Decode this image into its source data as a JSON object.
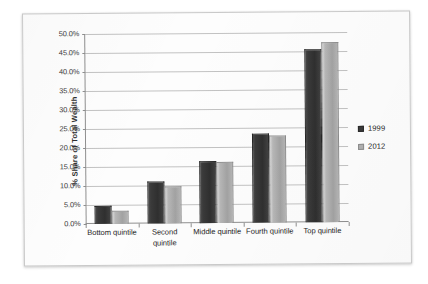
{
  "chart_data": {
    "type": "bar",
    "title": "",
    "subtitle": "",
    "xlabel": "",
    "ylabel": "% Share of Total Wealth",
    "categories": [
      "Bottom quintile",
      "Second quintile",
      "Middle quintile",
      "Fourth quintile",
      "Top quintile"
    ],
    "category_lines": [
      [
        "Bottom quintile"
      ],
      [
        "Second",
        "quintile"
      ],
      [
        "Middle quintile"
      ],
      [
        "Fourth quintile"
      ],
      [
        "Top quintile"
      ]
    ],
    "series": [
      {
        "name": "1999",
        "color": "#3a3a3a",
        "values": [
          4.8,
          11.0,
          16.3,
          23.5,
          45.5
        ]
      },
      {
        "name": "2012",
        "color": "#b0b0b0",
        "values": [
          3.5,
          9.7,
          16.0,
          23.0,
          47.5
        ]
      }
    ],
    "ylim": [
      0,
      50
    ],
    "ytick_values": [
      0,
      5,
      10,
      15,
      20,
      25,
      30,
      35,
      40,
      45,
      50
    ],
    "ytick_labels": [
      "0.0%",
      "5.0%",
      "10.0%",
      "15.0%",
      "20.0%",
      "25.0%",
      "30.0%",
      "35.0%",
      "40.0%",
      "45.0%",
      "50.0%"
    ],
    "grid": true,
    "grid_axis": "y",
    "legend_position": "right",
    "legend_entries": [
      "1999",
      "2012"
    ]
  }
}
